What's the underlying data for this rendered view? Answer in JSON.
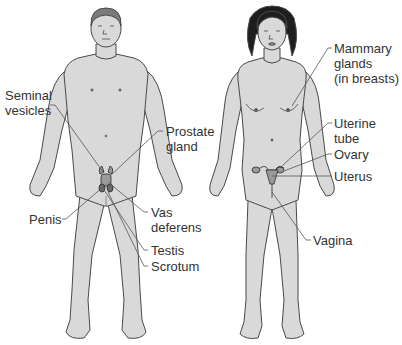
{
  "diagram": {
    "colors": {
      "skin": "#d9d9d9",
      "outline": "#4a4a4a",
      "hair_male": "#7a7a7a",
      "hair_female": "#1e1e1e",
      "leader_line": "#555555",
      "label_text": "#333333",
      "background": "#ffffff"
    },
    "male_figure": {
      "labels": [
        {
          "id": "seminal-vesicles",
          "text_lines": [
            "Seminal",
            "vesicles"
          ]
        },
        {
          "id": "prostate-gland",
          "text_lines": [
            "Prostate",
            "gland"
          ]
        },
        {
          "id": "penis",
          "text_lines": [
            "Penis"
          ]
        },
        {
          "id": "vas-deferens",
          "text_lines": [
            "Vas",
            "deferens"
          ]
        },
        {
          "id": "testis",
          "text_lines": [
            "Testis"
          ]
        },
        {
          "id": "scrotum",
          "text_lines": [
            "Scrotum"
          ]
        }
      ]
    },
    "female_figure": {
      "labels": [
        {
          "id": "mammary-glands",
          "text_lines": [
            "Mammary",
            "glands",
            "(in breasts)"
          ]
        },
        {
          "id": "uterine-tube",
          "text_lines": [
            "Uterine",
            "tube"
          ]
        },
        {
          "id": "ovary",
          "text_lines": [
            "Ovary"
          ]
        },
        {
          "id": "uterus",
          "text_lines": [
            "Uterus"
          ]
        },
        {
          "id": "vagina",
          "text_lines": [
            "Vagina"
          ]
        }
      ]
    }
  }
}
